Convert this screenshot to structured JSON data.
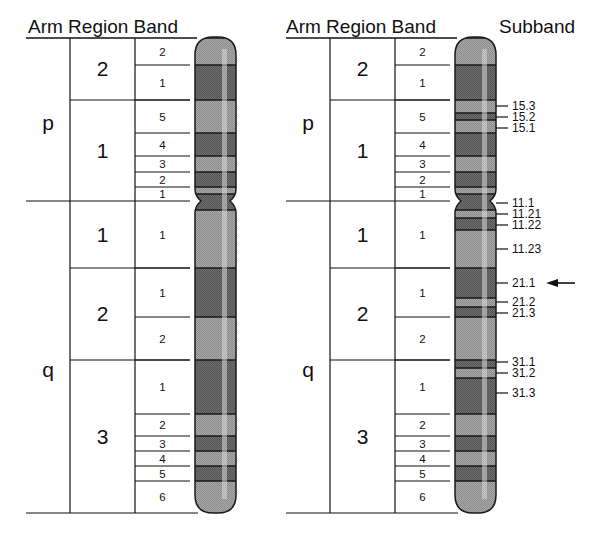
{
  "headers": {
    "left": "Arm Region Band",
    "right": "Arm Region Band",
    "subband": "Subband"
  },
  "arms": [
    {
      "label": "p",
      "y": 123
    },
    {
      "label": "q",
      "y": 370
    }
  ],
  "regions": [
    {
      "label": "2",
      "y0": 38,
      "y1": 100
    },
    {
      "label": "1",
      "y0": 100,
      "y1": 201
    },
    {
      "label": "1",
      "y0": 201,
      "y1": 268
    },
    {
      "label": "2",
      "y0": 268,
      "y1": 360
    },
    {
      "label": "3",
      "y0": 360,
      "y1": 513
    }
  ],
  "bands": [
    {
      "label": "2",
      "y0": 38,
      "y1": 65,
      "shade": "light"
    },
    {
      "label": "1",
      "y0": 65,
      "y1": 100,
      "shade": "dark"
    },
    {
      "label": "5",
      "y0": 100,
      "y1": 133,
      "shade": "light"
    },
    {
      "label": "4",
      "y0": 133,
      "y1": 156,
      "shade": "dark"
    },
    {
      "label": "3",
      "y0": 156,
      "y1": 172,
      "shade": "light"
    },
    {
      "label": "2",
      "y0": 172,
      "y1": 187,
      "shade": "dark"
    },
    {
      "label": "1",
      "y0": 187,
      "y1": 201,
      "shade": "light"
    },
    {
      "label": "1",
      "y0": 201,
      "y1": 268,
      "shade": "light"
    },
    {
      "label": "1",
      "y0": 268,
      "y1": 317,
      "shade": "dark"
    },
    {
      "label": "2",
      "y0": 317,
      "y1": 360,
      "shade": "light"
    },
    {
      "label": "1",
      "y0": 360,
      "y1": 414,
      "shade": "dark"
    },
    {
      "label": "2",
      "y0": 414,
      "y1": 436,
      "shade": "light"
    },
    {
      "label": "3",
      "y0": 436,
      "y1": 451,
      "shade": "dark"
    },
    {
      "label": "4",
      "y0": 451,
      "y1": 466,
      "shade": "light"
    },
    {
      "label": "5",
      "y0": 466,
      "y1": 481,
      "shade": "dark"
    },
    {
      "label": "6",
      "y0": 481,
      "y1": 513,
      "shade": "light"
    }
  ],
  "subband_stripes": [
    {
      "y0": 38,
      "y1": 65,
      "shade": "light"
    },
    {
      "y0": 65,
      "y1": 100,
      "shade": "dark"
    },
    {
      "y0": 100,
      "y1": 113,
      "shade": "light"
    },
    {
      "y0": 113,
      "y1": 120,
      "shade": "dark"
    },
    {
      "y0": 120,
      "y1": 133,
      "shade": "light"
    },
    {
      "y0": 133,
      "y1": 156,
      "shade": "dark"
    },
    {
      "y0": 156,
      "y1": 172,
      "shade": "light"
    },
    {
      "y0": 172,
      "y1": 187,
      "shade": "dark"
    },
    {
      "y0": 187,
      "y1": 194,
      "shade": "light"
    },
    {
      "y0": 194,
      "y1": 210,
      "shade": "dark"
    },
    {
      "y0": 210,
      "y1": 218,
      "shade": "light"
    },
    {
      "y0": 218,
      "y1": 230,
      "shade": "dark"
    },
    {
      "y0": 230,
      "y1": 268,
      "shade": "light"
    },
    {
      "y0": 268,
      "y1": 298,
      "shade": "dark"
    },
    {
      "y0": 298,
      "y1": 307,
      "shade": "light"
    },
    {
      "y0": 307,
      "y1": 317,
      "shade": "dark"
    },
    {
      "y0": 317,
      "y1": 360,
      "shade": "light"
    },
    {
      "y0": 360,
      "y1": 368,
      "shade": "dark"
    },
    {
      "y0": 368,
      "y1": 378,
      "shade": "light"
    },
    {
      "y0": 378,
      "y1": 414,
      "shade": "dark"
    },
    {
      "y0": 414,
      "y1": 436,
      "shade": "light"
    },
    {
      "y0": 436,
      "y1": 451,
      "shade": "dark"
    },
    {
      "y0": 451,
      "y1": 466,
      "shade": "light"
    },
    {
      "y0": 466,
      "y1": 481,
      "shade": "dark"
    },
    {
      "y0": 481,
      "y1": 513,
      "shade": "light"
    }
  ],
  "subbands": [
    {
      "label": "15.3",
      "y": 106
    },
    {
      "label": "15.2",
      "y": 117
    },
    {
      "label": "15.1",
      "y": 128
    },
    {
      "label": "11.1",
      "y": 203
    },
    {
      "label": "11.21",
      "y": 214
    },
    {
      "label": "11.22",
      "y": 225
    },
    {
      "label": "11.23",
      "y": 249
    },
    {
      "label": "21.1",
      "y": 283
    },
    {
      "label": "21.2",
      "y": 302
    },
    {
      "label": "21.3",
      "y": 313
    },
    {
      "label": "31.1",
      "y": 362
    },
    {
      "label": "31.2",
      "y": 373
    },
    {
      "label": "31.3",
      "y": 393
    }
  ],
  "highlight": {
    "subband": "21.1",
    "arrow": "left-arrow"
  },
  "colors": {
    "dark": "#6b6b6b",
    "light": "#a9a9a9",
    "line": "#111111",
    "highlight_stripe": "#d8d8d8"
  }
}
